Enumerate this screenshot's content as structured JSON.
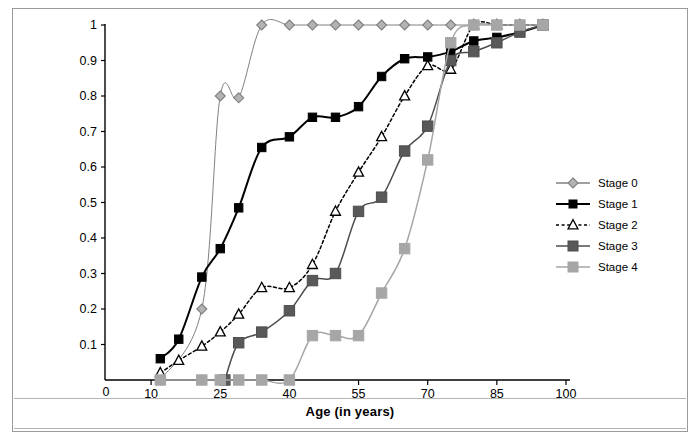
{
  "figure": {
    "axis_title": "Age (in years)",
    "background_color": "#ffffff",
    "frame_color": "#9a9a9a"
  },
  "legend": {
    "position": "right",
    "items": [
      {
        "label": "Stage 0",
        "marker": "diamond",
        "color": "#808080",
        "fill": "#b3b3b3",
        "line": "solid",
        "line_color": "#808080"
      },
      {
        "label": "Stage 1",
        "marker": "square",
        "color": "#000000",
        "fill": "#000000",
        "line": "solid",
        "line_color": "#000000"
      },
      {
        "label": "Stage 2",
        "marker": "triangle",
        "color": "#000000",
        "fill": "#ffffff",
        "line": "dotted",
        "line_color": "#000000"
      },
      {
        "label": "Stage 3",
        "marker": "square",
        "color": "#4d4d4d",
        "fill": "#595959",
        "line": "solid",
        "line_color": "#4d4d4d"
      },
      {
        "label": "Stage 4",
        "marker": "square",
        "color": "#a6a6a6",
        "fill": "#a6a6a6",
        "line": "solid",
        "line_color": "#a6a6a6"
      }
    ]
  },
  "chart_data": {
    "type": "line",
    "title": "",
    "xlabel": "Age (in years)",
    "ylabel": "",
    "xlim": [
      0,
      100
    ],
    "ylim": [
      0,
      1
    ],
    "xticks": [
      0,
      10,
      25,
      40,
      55,
      70,
      85,
      100
    ],
    "yticks": [
      0,
      0.1,
      0.2,
      0.3,
      0.4,
      0.5,
      0.6,
      0.7,
      0.8,
      0.9,
      1
    ],
    "grid": false,
    "legend_position": "right",
    "series": [
      {
        "name": "Stage 0",
        "marker": "diamond",
        "color": "#808080",
        "x": [
          12,
          21,
          25,
          29,
          34,
          40,
          45,
          50,
          55,
          60,
          65,
          70,
          75,
          80,
          85,
          90,
          95
        ],
        "y": [
          0.0,
          0.2,
          0.8,
          0.795,
          1.0,
          1.0,
          1.0,
          1.0,
          1.0,
          1.0,
          1.0,
          1.0,
          1.0,
          1.0,
          1.0,
          1.0,
          1.0
        ]
      },
      {
        "name": "Stage 1",
        "marker": "square",
        "color": "#000000",
        "x": [
          12,
          16,
          21,
          25,
          29,
          34,
          40,
          45,
          50,
          55,
          60,
          65,
          70,
          75,
          80,
          85,
          90,
          95
        ],
        "y": [
          0.06,
          0.115,
          0.29,
          0.37,
          0.485,
          0.655,
          0.685,
          0.74,
          0.74,
          0.77,
          0.855,
          0.905,
          0.91,
          0.925,
          0.955,
          0.965,
          0.98,
          1.0
        ]
      },
      {
        "name": "Stage 2",
        "marker": "triangle",
        "color": "#000000",
        "x": [
          12,
          16,
          21,
          25,
          29,
          34,
          40,
          45,
          50,
          55,
          60,
          65,
          70,
          75,
          80,
          85,
          90,
          95
        ],
        "y": [
          0.02,
          0.055,
          0.095,
          0.135,
          0.185,
          0.26,
          0.26,
          0.325,
          0.475,
          0.585,
          0.685,
          0.8,
          0.885,
          0.875,
          1.0,
          1.0,
          1.0,
          1.0
        ]
      },
      {
        "name": "Stage 3",
        "marker": "square",
        "color": "#4d4d4d",
        "x": [
          26,
          29,
          34,
          40,
          45,
          50,
          55,
          60,
          65,
          70,
          75,
          80,
          85,
          90,
          95
        ],
        "y": [
          0.0,
          0.105,
          0.135,
          0.195,
          0.28,
          0.3,
          0.475,
          0.515,
          0.645,
          0.715,
          0.9,
          0.925,
          0.95,
          0.98,
          1.0
        ]
      },
      {
        "name": "Stage 4",
        "marker": "square",
        "color": "#a6a6a6",
        "x": [
          12,
          21,
          25,
          29,
          34,
          40,
          45,
          50,
          55,
          60,
          65,
          70,
          75,
          80,
          85,
          90,
          95
        ],
        "y": [
          0.0,
          0.0,
          0.0,
          0.0,
          0.0,
          0.0,
          0.125,
          0.125,
          0.125,
          0.245,
          0.37,
          0.62,
          0.95,
          1.0,
          1.0,
          1.0,
          1.0
        ]
      }
    ]
  }
}
